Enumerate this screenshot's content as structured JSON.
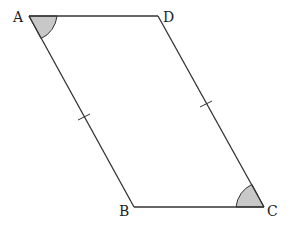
{
  "figure": {
    "type": "parallelogram",
    "vertices": {
      "A": {
        "label": "A"
      },
      "B": {
        "label": "B"
      },
      "C": {
        "label": "C"
      },
      "D": {
        "label": "D"
      }
    },
    "marked_angles": [
      "A",
      "C"
    ],
    "equal_sides_marked": [
      "AB",
      "DC"
    ],
    "colors": {
      "stroke": "#333333",
      "angle_fill": "#c8c8c8"
    }
  }
}
